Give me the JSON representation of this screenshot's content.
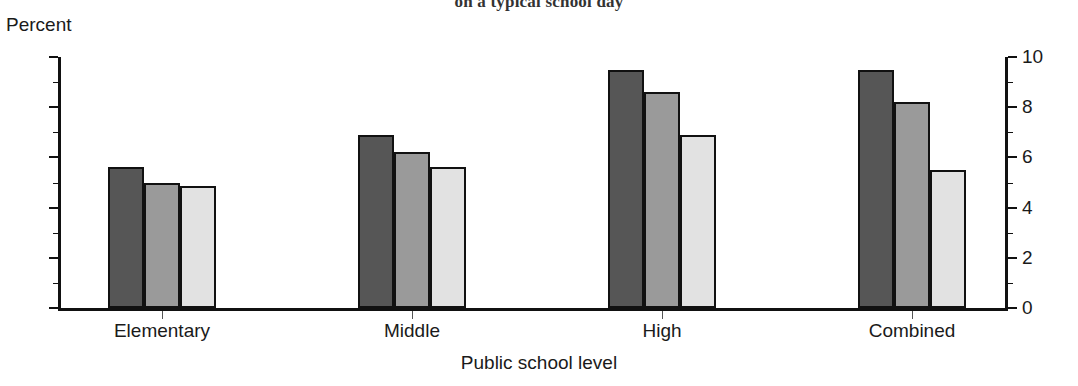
{
  "chart_data": {
    "type": "bar",
    "title": "on a typical school day",
    "title_note": "Title is cropped at top edge of screenshot; only the last line is visible.",
    "xlabel": "Public school level",
    "ylabel": "Percent",
    "categories": [
      "Elementary",
      "Middle",
      "High",
      "Combined"
    ],
    "series": [
      {
        "name": "series-1-dark",
        "color": "#565656",
        "values": [
          5.6,
          6.9,
          9.5,
          9.5
        ]
      },
      {
        "name": "series-2-medium",
        "color": "#9a9a9a",
        "values": [
          5.0,
          6.2,
          8.6,
          8.2
        ]
      },
      {
        "name": "series-3-light",
        "color": "#e2e2e2",
        "values": [
          4.85,
          5.6,
          6.9,
          5.5
        ]
      }
    ],
    "ylim": [
      0,
      10
    ],
    "ytick_labels_left": [
      "10",
      "8",
      "6",
      "4",
      "2",
      "0"
    ],
    "ytick_labels_right": [
      "10",
      "8",
      "6",
      "4",
      "2",
      "0"
    ],
    "ytick_values": [
      10,
      8,
      6,
      4,
      2,
      0
    ],
    "yminor_values": [
      9,
      7,
      5,
      3,
      1
    ],
    "grid": false,
    "legend": "none",
    "dual_axis": true,
    "axis_color": "#111111",
    "background": "#ffffff"
  }
}
